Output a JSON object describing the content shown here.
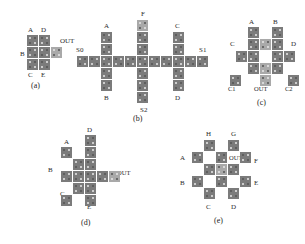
{
  "figure": {
    "kind": "qca-cell-layout-figure",
    "background": "#ffffff",
    "cell_color": "#7b7b7b",
    "cell_highlight_color": "#a9a9a9",
    "dot_color": "#e9e9e9",
    "label_color": "#2b2b2b"
  },
  "panels": [
    {
      "id": "a",
      "caption": "(a)",
      "labels": [
        "A",
        "D",
        "B",
        "OUT",
        "C",
        "E"
      ],
      "label_A": "A",
      "label_D": "D",
      "label_B": "B",
      "label_OUT": "OUT",
      "label_C": "C",
      "label_E": "E",
      "cell_count": 7,
      "shape": "2x3 block plus output cell"
    },
    {
      "id": "b",
      "caption": "(b)",
      "labels": [
        "A",
        "F",
        "C",
        "S0",
        "S1",
        "B",
        "S2",
        "D"
      ],
      "label_A": "A",
      "label_F": "F",
      "label_C": "C",
      "label_S0": "S0",
      "label_S1": "S1",
      "label_B": "B",
      "label_S2": "S2",
      "label_D": "D",
      "cell_count": 25,
      "shape": "horizontal bus with three crossing columns"
    },
    {
      "id": "c",
      "caption": "(c)",
      "labels": [
        "A",
        "B",
        "C",
        "D",
        "C1",
        "OUT",
        "C2"
      ],
      "label_A": "A",
      "label_B": "B",
      "label_C": "C",
      "label_D": "D",
      "label_C1": "C1",
      "label_OUT": "OUT",
      "label_C2": "C2",
      "cell_count": 15,
      "shape": "open square ring with three bottom taps"
    },
    {
      "id": "d",
      "caption": "(d)",
      "labels": [
        "D",
        "A",
        "B",
        "OUT",
        "C",
        "E"
      ],
      "label_D": "D",
      "label_A": "A",
      "label_B": "B",
      "label_OUT": "OUT",
      "label_C": "C",
      "label_E": "E",
      "cell_count": 16,
      "shape": "diamond / rotated majority block"
    },
    {
      "id": "e",
      "caption": "(e)",
      "labels": [
        "H",
        "G",
        "A",
        "OUT",
        "F",
        "B",
        "E",
        "C",
        "D"
      ],
      "label_H": "H",
      "label_G": "G",
      "label_A": "A",
      "label_OUT": "OUT",
      "label_F": "F",
      "label_B": "B",
      "label_E": "E",
      "label_C": "C",
      "label_D": "D",
      "cell_count": 13,
      "shape": "checkerboard diamond"
    }
  ]
}
